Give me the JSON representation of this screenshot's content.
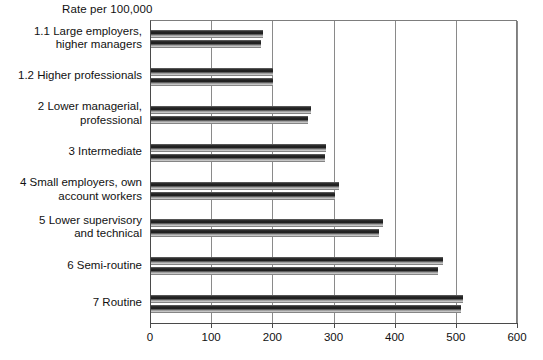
{
  "chart_data": {
    "type": "bar",
    "orientation": "horizontal",
    "title": "",
    "axis_note": "Rate per 100,000",
    "xlabel": "",
    "ylabel": "",
    "xlim": [
      0,
      600
    ],
    "xticks": [
      0,
      100,
      200,
      300,
      400,
      500,
      600
    ],
    "xticklabels": [
      "0",
      "100",
      "200",
      "300",
      "400",
      "500",
      "600"
    ],
    "grid": "vertical",
    "legend": "none",
    "categories": [
      "1.1 Large employers,\nhigher managers",
      "1.2 Higher professionals",
      "2 Lower managerial,\nprofessional",
      "3 Intermediate",
      "4 Small employers, own\naccount workers",
      "5 Lower supervisory\nand technical",
      "6 Semi-routine",
      "7 Routine"
    ],
    "series": [
      {
        "name": "Series 1",
        "values": [
          183,
          200,
          261,
          286,
          307,
          379,
          477,
          510
        ]
      },
      {
        "name": "Series 2",
        "values": [
          180,
          200,
          257,
          284,
          301,
          372,
          469,
          507
        ]
      }
    ],
    "bar_color": "#2e2e2e",
    "gridline_color": "#8a8a8a",
    "axis_color": "#4a4a4a",
    "background_color": "#ffffff"
  }
}
